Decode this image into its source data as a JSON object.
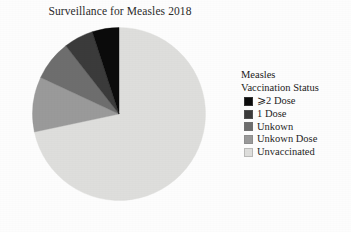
{
  "chart_data": {
    "type": "pie",
    "title": "Surveillance for Measles 2018",
    "legend_title_line1": "Measles",
    "legend_title_line2": "Vaccination Status",
    "legend_position": "right",
    "start_angle_deg": 0,
    "direction": "clockwise",
    "categories": [
      "⩾2 Dose",
      "1 Dose",
      "Unkown",
      "Unkown Dose",
      "Unvaccinated"
    ],
    "values": [
      5,
      5.5,
      7.5,
      10.5,
      71.5
    ],
    "value_unit": "percent",
    "slice_angles_deg": [
      18,
      20,
      27,
      37,
      258
    ],
    "colors": [
      "#0b0b0b",
      "#3b3b3b",
      "#6e6e6e",
      "#9a9a9a",
      "#dededc"
    ],
    "slices": [
      {
        "label": "⩾2 Dose",
        "value": 5,
        "angle_deg": 18,
        "color": "#0b0b0b"
      },
      {
        "label": "1 Dose",
        "value": 5.5,
        "angle_deg": 20,
        "color": "#3b3b3b"
      },
      {
        "label": "Unkown",
        "value": 7.5,
        "angle_deg": 27,
        "color": "#6e6e6e"
      },
      {
        "label": "Unkown Dose",
        "value": 10.5,
        "angle_deg": 37,
        "color": "#9a9a9a"
      },
      {
        "label": "Unvaccinated",
        "value": 71.5,
        "angle_deg": 258,
        "color": "#dededc"
      }
    ],
    "draw_order_clockwise_from_top": [
      "Unvaccinated",
      "Unkown Dose",
      "Unkown",
      "1 Dose",
      "⩾2 Dose"
    ],
    "xlabel": "",
    "ylabel": "",
    "grid": false
  }
}
